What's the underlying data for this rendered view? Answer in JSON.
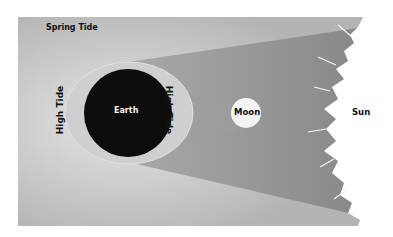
{
  "title": "Spring Tide",
  "labels": {
    "earth": "Earth",
    "moon": "Moon",
    "sun": "Sun",
    "high_tide_left": "High Tide",
    "high_tide_right": "High Tide"
  },
  "colors": {
    "background": "#b9b9b9",
    "cone": "#8e8e8e",
    "earth": "#0d0d0d",
    "tidal_bulge": "#cfcfcf",
    "moon": "#f4f4f4",
    "sun": "#ffffff"
  }
}
